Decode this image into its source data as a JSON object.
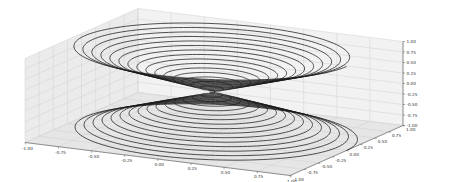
{
  "chart_data": {
    "type": "line",
    "subtype": "3d-parametric",
    "title": "",
    "xlabel": "",
    "ylabel": "",
    "zlabel": "",
    "parametric": {
      "z_range": [
        -1.0,
        1.0
      ],
      "radius": "abs(z)",
      "turns_per_cone": 16,
      "points": 4000
    },
    "xlim": [
      -1.0,
      1.0
    ],
    "ylim": [
      -1.0,
      1.0
    ],
    "zlim": [
      -1.0,
      1.0
    ],
    "x_ticks": [
      "-1.00",
      "-0.75",
      "-0.50",
      "-0.25",
      "0.00",
      "0.25",
      "0.50",
      "0.75",
      "1.00"
    ],
    "y_ticks": [
      "-1.00",
      "-0.75",
      "-0.50",
      "-0.25",
      "0.00",
      "0.25",
      "0.50",
      "0.75",
      "1.00"
    ],
    "z_ticks": [
      "1.00",
      "0.75",
      "0.50",
      "0.25",
      "0.00",
      "-0.25",
      "-0.50",
      "-0.75",
      "-1.00"
    ],
    "grid": true,
    "legend": null,
    "colors": {
      "line": "#1a1a1a",
      "pane_back": "#f2f2f2",
      "pane_side": "#ebebeb",
      "pane_floor": "#e6e6e6",
      "grid": "#d0d0d0",
      "axis": "#555555"
    }
  }
}
